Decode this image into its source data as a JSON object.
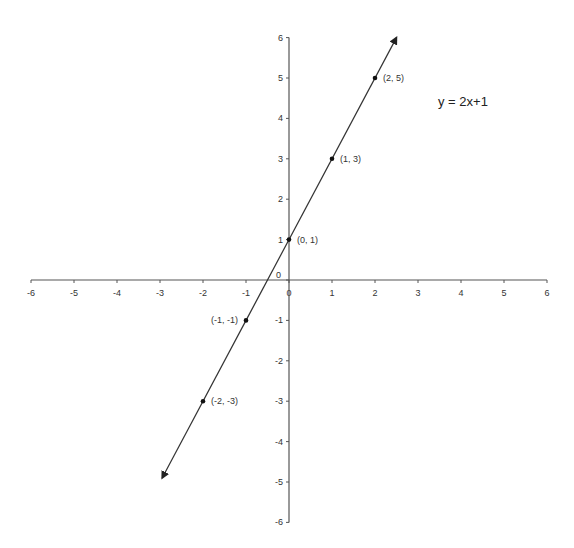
{
  "chart_data": {
    "type": "line",
    "title": "",
    "xlabel": "",
    "ylabel": "",
    "xlim": [
      -6,
      6
    ],
    "ylim": [
      -6,
      6
    ],
    "grid": false,
    "equation_label": "y = 2x+1",
    "x_ticks": [
      -6,
      -5,
      -4,
      -3,
      -2,
      -1,
      0,
      1,
      2,
      3,
      4,
      5,
      6
    ],
    "y_ticks": [
      -6,
      -5,
      -4,
      -3,
      -2,
      -1,
      0,
      1,
      2,
      3,
      4,
      5,
      6
    ],
    "series": [
      {
        "name": "y = 2x+1",
        "line_extent_x": [
          -2.95,
          2.5
        ],
        "arrows_both_ends": true,
        "points": [
          {
            "x": -2,
            "y": -3,
            "label": "(-2, -3)"
          },
          {
            "x": -1,
            "y": -1,
            "label": "(-1, -1)"
          },
          {
            "x": 0,
            "y": 1,
            "label": "(0, 1)"
          },
          {
            "x": 1,
            "y": 3,
            "label": "(1, 3)"
          },
          {
            "x": 2,
            "y": 5,
            "label": "(2, 5)"
          }
        ]
      }
    ]
  },
  "colors": {
    "axis": "#555555",
    "line": "#333333",
    "point": "#111111",
    "text": "#333333"
  }
}
